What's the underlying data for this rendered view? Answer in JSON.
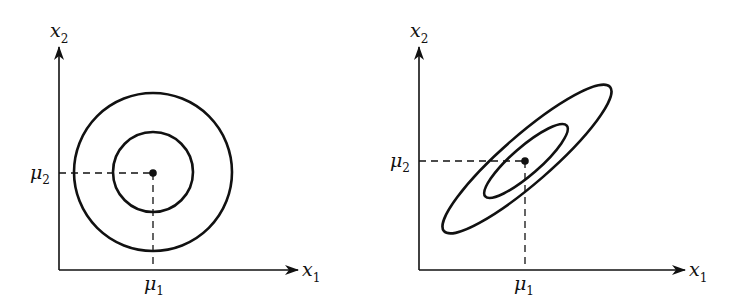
{
  "figure": {
    "colors": {
      "ink": "#111111",
      "background": "#ffffff"
    },
    "panels": [
      {
        "id": "left",
        "caption": "Uncorrelated, equal variance (circular contours)",
        "axis_x": {
          "symbol": "x",
          "subscript": "1"
        },
        "axis_y": {
          "symbol": "x",
          "subscript": "2"
        },
        "mean_x": {
          "symbol": "μ",
          "subscript": "1"
        },
        "mean_y": {
          "symbol": "μ",
          "subscript": "2"
        },
        "contours": [
          "inner-circle",
          "outer-circle"
        ]
      },
      {
        "id": "right",
        "caption": "Positively correlated (tilted elliptical contours)",
        "axis_x": {
          "symbol": "x",
          "subscript": "1"
        },
        "axis_y": {
          "symbol": "x",
          "subscript": "2"
        },
        "mean_x": {
          "symbol": "μ",
          "subscript": "1"
        },
        "mean_y": {
          "symbol": "μ",
          "subscript": "2"
        },
        "contours": [
          "inner-ellipse",
          "outer-ellipse"
        ]
      }
    ]
  }
}
